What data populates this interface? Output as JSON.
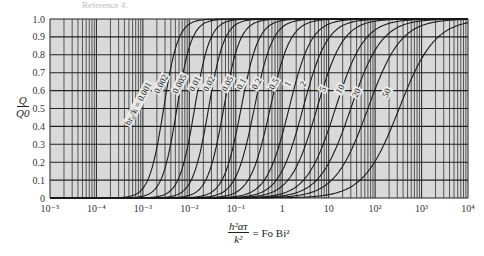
{
  "caption_fragment": "Reference 4.",
  "axes": {
    "y_label_num": "Q",
    "y_label_den": "Q0",
    "x_label_num": "h²ατ",
    "x_label_den": "k²",
    "x_label_rhs": "= Fo Bi²"
  },
  "chart_data": {
    "type": "line",
    "title": "",
    "xlabel": "h²ατ/k² = Fo Bi²",
    "ylabel": "Q/Q0",
    "xscale": "log",
    "xlim": [
      1e-05,
      10000.0
    ],
    "ylim": [
      0,
      1.0
    ],
    "grid": true,
    "background": "#d9d9d9",
    "x_ticks": [
      "10⁻⁵",
      "10⁻⁴",
      "10⁻³",
      "10⁻²",
      "10⁻¹",
      "1",
      "10",
      "10²",
      "10³",
      "10⁴"
    ],
    "y_ticks": [
      "0",
      "0.1",
      "0.2",
      "0.3",
      "0.4",
      "0.5",
      "0.6",
      "0.7",
      "0.8",
      "0.9",
      "1.0"
    ],
    "legend_prefix": "hr₀/k =",
    "series": [
      {
        "name": "0.001",
        "x_half": 0.0028,
        "log_width": 0.55
      },
      {
        "name": "0.002",
        "x_half": 0.0054,
        "log_width": 0.56
      },
      {
        "name": "0.005",
        "x_half": 0.013,
        "log_width": 0.58
      },
      {
        "name": "0.01",
        "x_half": 0.026,
        "log_width": 0.6
      },
      {
        "name": "0.02",
        "x_half": 0.055,
        "log_width": 0.62
      },
      {
        "name": "0.05",
        "x_half": 0.13,
        "log_width": 0.66
      },
      {
        "name": "0.1",
        "x_half": 0.25,
        "log_width": 0.7
      },
      {
        "name": "0.2",
        "x_half": 0.55,
        "log_width": 0.76
      },
      {
        "name": "0.5",
        "x_half": 1.4,
        "log_width": 0.85
      },
      {
        "name": "1",
        "x_half": 2.8,
        "log_width": 0.92
      },
      {
        "name": "2",
        "x_half": 5.6,
        "log_width": 1.0
      },
      {
        "name": "5",
        "x_half": 14,
        "log_width": 1.1
      },
      {
        "name": "10",
        "x_half": 30,
        "log_width": 1.18
      },
      {
        "name": "20",
        "x_half": 70,
        "log_width": 1.25
      },
      {
        "name": "50",
        "x_half": 330,
        "log_width": 1.35
      }
    ],
    "curve_label_positions": [
      {
        "name": "hr₀/k = 0.001",
        "x": 0.0009,
        "y": 0.52
      },
      {
        "name": "0.002",
        "x": 0.0028,
        "y": 0.63
      },
      {
        "name": "0.005",
        "x": 0.007,
        "y": 0.63
      },
      {
        "name": "0.01",
        "x": 0.015,
        "y": 0.63
      },
      {
        "name": "0.02",
        "x": 0.03,
        "y": 0.63
      },
      {
        "name": "0.05",
        "x": 0.075,
        "y": 0.63
      },
      {
        "name": "0.1",
        "x": 0.15,
        "y": 0.63
      },
      {
        "name": "0.2",
        "x": 0.32,
        "y": 0.63
      },
      {
        "name": "0.5",
        "x": 0.75,
        "y": 0.63
      },
      {
        "name": "1",
        "x": 1.5,
        "y": 0.63
      },
      {
        "name": "2",
        "x": 3.2,
        "y": 0.63
      },
      {
        "name": "5",
        "x": 8.5,
        "y": 0.6
      },
      {
        "name": "10",
        "x": 20,
        "y": 0.6
      },
      {
        "name": "20",
        "x": 45,
        "y": 0.58
      },
      {
        "name": "50",
        "x": 200,
        "y": 0.58
      }
    ]
  }
}
